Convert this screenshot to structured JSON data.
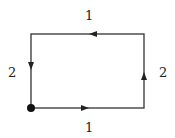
{
  "diagram": {
    "type": "rectangular-loop",
    "edges": [
      {
        "side": "bottom",
        "label": "1",
        "direction": "right"
      },
      {
        "side": "right",
        "label": "2",
        "direction": "up"
      },
      {
        "side": "top",
        "label": "1",
        "direction": "left"
      },
      {
        "side": "left",
        "label": "2",
        "direction": "down"
      }
    ],
    "start_point": "bottom-left",
    "colors": {
      "stroke": "#333333",
      "dot": "#111111"
    }
  }
}
